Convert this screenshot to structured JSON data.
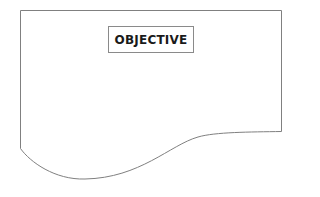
{
  "diagram": {
    "type": "flowchart-document-shape",
    "label": "OBJECTIVE",
    "colors": {
      "stroke": "#808080",
      "text": "#1a1a1a",
      "background": "#ffffff"
    }
  }
}
